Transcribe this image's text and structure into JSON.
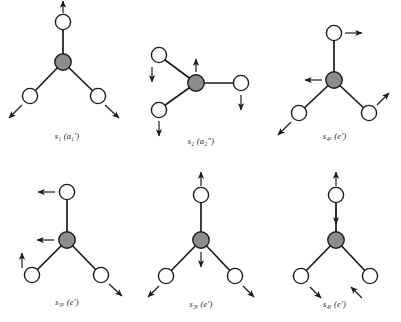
{
  "figure": {
    "background_color": "#ffffff",
    "central_atom_color": "#8c8c8c",
    "outer_atom_color": "#ffffff",
    "bond_color": "#1b1b1b",
    "arrow_color": "#1b1b1b"
  },
  "panels": [
    {
      "id": "s1",
      "label_main": "s",
      "label_sub": "1",
      "label_sym": "(a",
      "label_sym_sub": "1",
      "label_sym_prime": "′)",
      "label_text": "s₁ (a₁′)",
      "description": "symmetric stretch, all bonds lengthen outward",
      "geometry": {
        "center": [
          63,
          62
        ],
        "outer_atoms": [
          {
            "name": "top",
            "pos": [
              63,
              22
            ]
          },
          {
            "name": "lower-left",
            "pos": [
              30,
              96
            ]
          },
          {
            "name": "lower-right",
            "pos": [
              98,
              96
            ]
          }
        ]
      },
      "arrows": [
        {
          "name": "top-arrow",
          "from": [
            63,
            14
          ],
          "to": [
            63,
            0
          ],
          "direction": "up"
        },
        {
          "name": "lower-left-arrow",
          "from": [
            22,
            104
          ],
          "to": [
            8,
            118
          ],
          "direction": "down-left"
        },
        {
          "name": "lower-right-arrow",
          "from": [
            106,
            104
          ],
          "to": [
            120,
            118
          ],
          "direction": "down-right"
        }
      ]
    },
    {
      "id": "s2",
      "label_main": "s",
      "label_sub": "2",
      "label_text": "s₂ (a₂″)",
      "description": "out-of-plane bend, central atom up, outer atoms down",
      "geometry": {
        "center": [
          196,
          83
        ],
        "outer_atoms": [
          {
            "name": "upper-left",
            "pos": [
              159,
              55
            ]
          },
          {
            "name": "lower-left",
            "pos": [
              159,
              110
            ]
          },
          {
            "name": "right",
            "pos": [
              241,
              83
            ]
          }
        ]
      },
      "arrows": [
        {
          "name": "center-arrow",
          "from": [
            196,
            72
          ],
          "to": [
            196,
            58
          ],
          "direction": "up"
        },
        {
          "name": "upper-left-arrow",
          "from": [
            153,
            66
          ],
          "to": [
            153,
            82
          ],
          "direction": "down"
        },
        {
          "name": "lower-left-arrow",
          "from": [
            159,
            121
          ],
          "to": [
            159,
            136
          ],
          "direction": "down"
        },
        {
          "name": "right-arrow",
          "from": [
            241,
            94
          ],
          "to": [
            241,
            110
          ],
          "direction": "down"
        }
      ]
    },
    {
      "id": "s4x",
      "label_main": "s",
      "label_sub": "4x",
      "label_text": "s₄ₓ (e′)",
      "description": "degenerate bend, x component",
      "geometry": {
        "center": [
          334,
          80
        ],
        "outer_atoms": [
          {
            "name": "top",
            "pos": [
              334,
              33
            ]
          },
          {
            "name": "lower-left",
            "pos": [
              299,
              113
            ]
          },
          {
            "name": "lower-right",
            "pos": [
              369,
              113
            ]
          }
        ]
      },
      "arrows": [
        {
          "name": "top-arrow",
          "from": [
            346,
            33
          ],
          "to": [
            364,
            33
          ],
          "direction": "right"
        },
        {
          "name": "center-arrow",
          "from": [
            321,
            80
          ],
          "to": [
            303,
            80
          ],
          "direction": "left"
        },
        {
          "name": "lower-left-arrow",
          "from": [
            291,
            121
          ],
          "to": [
            277,
            135
          ],
          "direction": "down-left"
        },
        {
          "name": "lower-right-arrow",
          "from": [
            377,
            105
          ],
          "to": [
            390,
            92
          ],
          "direction": "up-right"
        }
      ]
    },
    {
      "id": "s3x",
      "label_main": "s",
      "label_sub": "3x",
      "label_text": "s₃ₓ (e′)",
      "description": "degenerate stretch, x component",
      "geometry": {
        "center": [
          67,
          240
        ],
        "outer_atoms": [
          {
            "name": "top",
            "pos": [
              67,
              192
            ]
          },
          {
            "name": "lower-left",
            "pos": [
              32,
              275
            ]
          },
          {
            "name": "lower-right",
            "pos": [
              101,
              275
            ]
          }
        ]
      },
      "arrows": [
        {
          "name": "top-arrow",
          "from": [
            55,
            192
          ],
          "to": [
            37,
            192
          ],
          "direction": "left"
        },
        {
          "name": "center-arrow",
          "from": [
            54,
            240
          ],
          "to": [
            36,
            240
          ],
          "direction": "left"
        },
        {
          "name": "lower-left-arrow",
          "from": [
            22,
            268
          ],
          "to": [
            22,
            252
          ],
          "direction": "up"
        },
        {
          "name": "lower-right-arrow",
          "from": [
            109,
            283
          ],
          "to": [
            123,
            296
          ],
          "direction": "down-right"
        }
      ]
    },
    {
      "id": "s3y",
      "label_main": "s",
      "label_sub": "3y",
      "label_text": "s₃ᵧ (e′)",
      "description": "degenerate stretch, y component",
      "geometry": {
        "center": [
          201,
          240
        ],
        "outer_atoms": [
          {
            "name": "top",
            "pos": [
              201,
              195
            ]
          },
          {
            "name": "lower-left",
            "pos": [
              166,
              276
            ]
          },
          {
            "name": "lower-right",
            "pos": [
              235,
              276
            ]
          }
        ]
      },
      "arrows": [
        {
          "name": "top-arrow",
          "from": [
            201,
            186
          ],
          "to": [
            201,
            171
          ],
          "direction": "up"
        },
        {
          "name": "center-arrow",
          "from": [
            201,
            251
          ],
          "to": [
            201,
            267
          ],
          "direction": "down"
        },
        {
          "name": "lower-left-arrow",
          "from": [
            159,
            286
          ],
          "to": [
            147,
            298
          ],
          "direction": "down-left"
        },
        {
          "name": "lower-right-arrow",
          "from": [
            243,
            286
          ],
          "to": [
            255,
            298
          ],
          "direction": "down-right"
        }
      ]
    },
    {
      "id": "s4y",
      "label_main": "s",
      "label_sub": "4y",
      "label_text": "s₄ᵧ (e′)",
      "description": "degenerate bend, y component",
      "geometry": {
        "center": [
          336,
          240
        ],
        "outer_atoms": [
          {
            "name": "top",
            "pos": [
              336,
              195
            ]
          },
          {
            "name": "lower-left",
            "pos": [
              301,
              276
            ]
          },
          {
            "name": "lower-right",
            "pos": [
              370,
              276
            ]
          }
        ]
      },
      "arrows": [
        {
          "name": "top-arrow",
          "from": [
            336,
            186
          ],
          "to": [
            336,
            171
          ],
          "direction": "up"
        },
        {
          "name": "center-arrow",
          "from": [
            336,
            208
          ],
          "to": [
            336,
            224
          ],
          "direction": "down"
        },
        {
          "name": "lower-left-arrow",
          "from": [
            310,
            287
          ],
          "to": [
            322,
            299
          ],
          "direction": "down-right"
        },
        {
          "name": "lower-right-arrow",
          "from": [
            362,
            299
          ],
          "to": [
            350,
            287
          ],
          "direction": "up-left"
        }
      ]
    }
  ]
}
